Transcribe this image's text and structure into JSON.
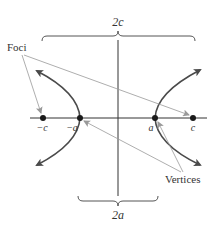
{
  "diagram": {
    "type": "hyperbola",
    "labels": {
      "top_brace": "2c",
      "bottom_brace": "2a",
      "foci": "Foci",
      "vertices": "Vertices",
      "neg_c": "−c",
      "neg_a": "−a",
      "pos_a": "a",
      "pos_c": "c"
    },
    "colors": {
      "curve": "#4a4a4a",
      "axis": "#333333",
      "leader": "#888888",
      "point": "#1a1a1a"
    }
  }
}
